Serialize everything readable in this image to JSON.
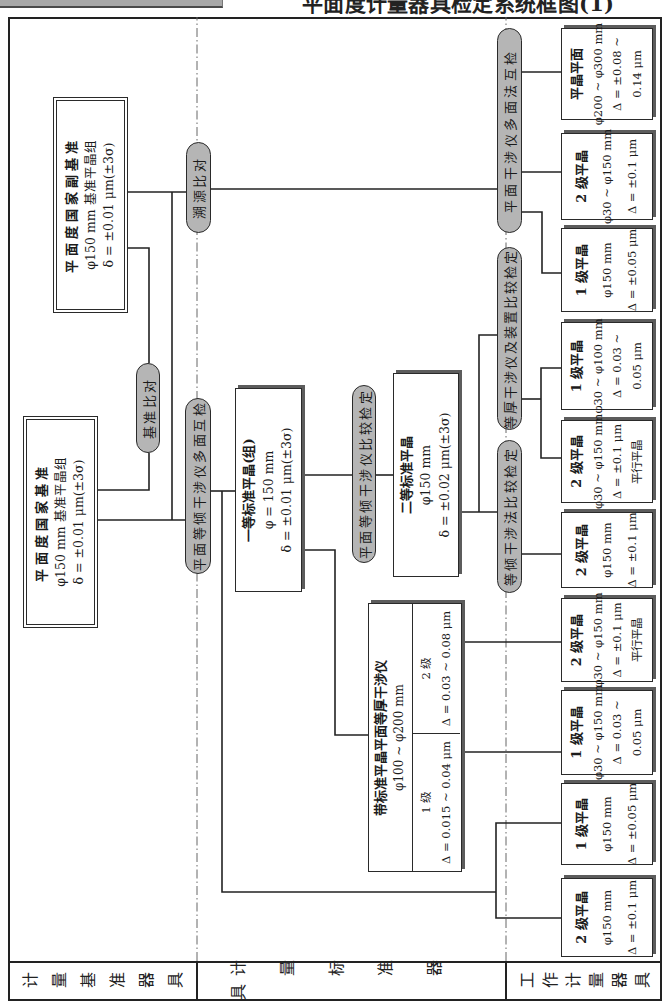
{
  "header": {
    "title": "平面度计量器具检定系统框图(1)"
  },
  "tiers": [
    {
      "label": "计量基准器具"
    },
    {
      "label": "计量标准器具"
    },
    {
      "label": "工作计量器具"
    }
  ],
  "primary_standards": {
    "national": {
      "lines": [
        "平面度国家基准",
        "φ150 mm 基准平晶组",
        "δ = ±0.01 μm(±3σ)"
      ]
    },
    "national_secondary": {
      "lines": [
        "平面度国家副基准",
        "φ150 mm 基准平晶组",
        "δ = ±0.01 μm(±3σ)"
      ]
    }
  },
  "methods": {
    "reference_comparison": "基准比对",
    "traceability_comparison": "溯源比对",
    "equal_inclination_multi_face": "平面等倾干涉仪多面互检",
    "equal_inclination_comparison": "平面等倾干涉仪比较检定",
    "equal_inclination_method": "等倾干涉法比较检定",
    "equal_thickness_device": "等厚干涉仪及装置比较检定",
    "plane_interferometer_multi_face": "平面干涉仪多面法互检"
  },
  "measurement_standards": {
    "first_grade": {
      "lines": [
        "一等标准平晶(组)",
        "φ = 150 mm",
        "δ = ±0.01 μm(±3σ)"
      ]
    },
    "second_grade": {
      "lines": [
        "二等标准平晶",
        "φ150 mm",
        "δ = ±0.02 μm(±3σ)"
      ]
    },
    "interferometer": {
      "title": "带标准平晶平面等厚干涉仪",
      "range": "φ100 ~ φ200 mm",
      "grades": [
        {
          "grade": "1 级",
          "spec": "Δ = 0.015 ~ 0.04 μm"
        },
        {
          "grade": "2 级",
          "spec": "Δ = 0.03 ~ 0.08 μm"
        }
      ]
    }
  },
  "working_instruments": [
    {
      "lines": [
        "平晶平面",
        "φ200 ~ φ300 mm",
        "Δ = ±0.08 ~",
        "0.14 μm"
      ]
    },
    {
      "lines": [
        "2 级平晶",
        "φ30 ~ φ150 mm",
        "Δ = ±0.1 μm"
      ]
    },
    {
      "lines": [
        "1 级平晶",
        "φ150 mm",
        "Δ = ±0.05 μm"
      ]
    },
    {
      "lines": [
        "1 级平晶",
        "φ30 ~ φ100 mm",
        "Δ = 0.03 ~",
        "0.05 μm"
      ]
    },
    {
      "lines": [
        "2 级平晶",
        "φ30 ~ φ150 mm",
        "Δ = ±0.1 μm",
        "平行平晶"
      ]
    },
    {
      "lines": [
        "2 级平晶",
        "φ150 mm",
        "Δ = ±0.1 μm"
      ]
    },
    {
      "lines": [
        "2 级平晶",
        "φ30 ~ φ150 mm",
        "Δ = ±0.1 μm",
        "平行平晶"
      ]
    },
    {
      "lines": [
        "1 级平晶",
        "φ30 ~ φ150 mm",
        "Δ = 0.03 ~",
        "0.05 μm"
      ]
    },
    {
      "lines": [
        "1 级平晶",
        "φ150 mm",
        "Δ = ±0.05 μm"
      ]
    },
    {
      "lines": [
        "2 级平晶",
        "φ150 mm",
        "Δ = ±0.1 μm"
      ]
    }
  ]
}
